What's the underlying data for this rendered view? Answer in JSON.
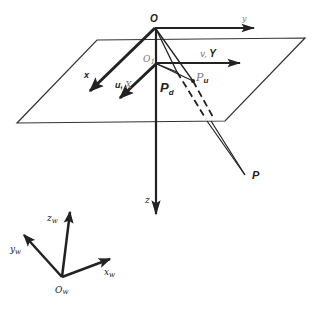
{
  "diagram": {
    "type": "camera-projection-geometry",
    "colors": {
      "stroke": "#222222",
      "plane": "#333333",
      "light_label": "#777777",
      "background": "#ffffff"
    },
    "camera_frame": {
      "origin_label": "O",
      "x_label": "x",
      "y_label": "y",
      "z_label": "z"
    },
    "image_plane": {
      "origin_label": "O",
      "origin_subscript": "1",
      "u_label": "u, X",
      "v_label": "v, Y",
      "u_prefix": "u,",
      "u_suffix": "X",
      "v_prefix": "v,",
      "v_suffix": "Y"
    },
    "points": {
      "distorted": {
        "label": "P",
        "subscript": "d"
      },
      "undistorted": {
        "label": "P",
        "subscript": "u"
      },
      "world": {
        "label": "P"
      }
    },
    "world_frame": {
      "origin_label": "O",
      "origin_subscript": "w",
      "x_label": "x",
      "x_subscript": "w",
      "y_label": "y",
      "y_subscript": "w",
      "z_label": "z",
      "z_subscript": "w"
    }
  }
}
